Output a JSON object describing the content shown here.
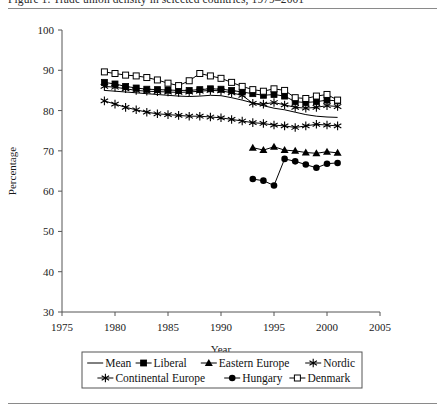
{
  "figure": {
    "title_cut": "Figure 1. Trade union density in selected countries, 1979–2001",
    "y_axis_label": "Percentage",
    "x_axis_label": "Year"
  },
  "chart_data": {
    "type": "line",
    "title": "",
    "xlabel": "Year",
    "ylabel": "Percentage",
    "xlim": [
      1975,
      2005
    ],
    "ylim": [
      30,
      100
    ],
    "xticks": [
      1975,
      1980,
      1985,
      1990,
      1995,
      2000,
      2005
    ],
    "yticks": [
      30,
      40,
      50,
      60,
      70,
      80,
      90,
      100
    ],
    "grid": false,
    "legend_position": "below-axes",
    "series": [
      {
        "name": "Mean",
        "marker": "none",
        "x": [
          1979,
          1980,
          1981,
          1982,
          1983,
          1984,
          1985,
          1986,
          1987,
          1988,
          1989,
          1990,
          1991,
          1992,
          1993,
          1994,
          1995,
          1996,
          1997,
          1998,
          1999,
          2000,
          2001
        ],
        "values": [
          85.0,
          84.8,
          84.6,
          84.4,
          84.2,
          84.0,
          83.8,
          83.6,
          83.5,
          83.6,
          83.8,
          83.7,
          83.2,
          82.6,
          81.9,
          81.2,
          80.6,
          80.2,
          79.6,
          79.0,
          78.6,
          78.4,
          78.3
        ]
      },
      {
        "name": "Liberal",
        "marker": "filled-square",
        "x": [
          1979,
          1980,
          1981,
          1982,
          1983,
          1984,
          1985,
          1986,
          1987,
          1988,
          1989,
          1990,
          1991,
          1992,
          1993,
          1994,
          1995,
          1996,
          1997,
          1998,
          1999,
          2000,
          2001
        ],
        "values": [
          87.0,
          86.6,
          86.0,
          85.6,
          85.3,
          85.2,
          85.1,
          85.0,
          85.0,
          85.2,
          85.4,
          85.3,
          85.0,
          84.6,
          84.2,
          83.8,
          84.0,
          83.6,
          82.2,
          82.0,
          82.2,
          82.6,
          82.4
        ]
      },
      {
        "name": "Eastern Europe",
        "marker": "filled-triangle",
        "x": [
          1993,
          1994,
          1995,
          1996,
          1997,
          1998,
          1999,
          2000,
          2001
        ],
        "values": [
          70.8,
          70.2,
          71.0,
          70.2,
          70.0,
          69.6,
          69.4,
          69.8,
          69.5
        ]
      },
      {
        "name": "Nordic",
        "marker": "star",
        "x": [
          1979,
          1980,
          1981,
          1982,
          1983,
          1984,
          1985,
          1986,
          1987,
          1988,
          1989,
          1990,
          1991,
          1992,
          1993,
          1994,
          1995,
          1996,
          1997,
          1998,
          1999,
          2000,
          2001
        ],
        "values": [
          86.0,
          85.8,
          85.4,
          85.0,
          84.8,
          84.7,
          84.6,
          84.5,
          84.6,
          84.8,
          85.0,
          84.9,
          84.4,
          83.8,
          81.8,
          81.6,
          82.0,
          81.4,
          80.8,
          80.6,
          80.8,
          81.2,
          81.0
        ]
      },
      {
        "name": "Continental Europe",
        "marker": "star",
        "x": [
          1979,
          1980,
          1981,
          1982,
          1983,
          1984,
          1985,
          1986,
          1987,
          1988,
          1989,
          1990,
          1991,
          1992,
          1993,
          1994,
          1995,
          1996,
          1997,
          1998,
          1999,
          2000,
          2001
        ],
        "values": [
          82.4,
          81.6,
          80.8,
          80.2,
          79.6,
          79.2,
          79.0,
          78.8,
          78.6,
          78.6,
          78.4,
          78.2,
          77.8,
          77.4,
          77.0,
          76.8,
          76.4,
          76.2,
          75.8,
          76.2,
          76.6,
          76.4,
          76.2
        ]
      },
      {
        "name": "Hungary",
        "marker": "filled-circle",
        "x": [
          1993,
          1994,
          1995,
          1996,
          1997,
          1998,
          1999,
          2000,
          2001
        ],
        "values": [
          63.0,
          62.6,
          61.4,
          68.0,
          67.4,
          66.6,
          65.8,
          66.8,
          67.0
        ]
      },
      {
        "name": "Denmark",
        "marker": "open-square",
        "x": [
          1979,
          1980,
          1981,
          1982,
          1983,
          1984,
          1985,
          1986,
          1987,
          1988,
          1989,
          1990,
          1991,
          1992,
          1993,
          1994,
          1995,
          1996,
          1997,
          1998,
          1999,
          2000,
          2001
        ],
        "values": [
          89.6,
          89.2,
          88.8,
          88.6,
          88.2,
          87.6,
          86.8,
          86.2,
          87.4,
          89.2,
          88.6,
          88.0,
          87.0,
          86.0,
          85.2,
          84.8,
          85.4,
          85.0,
          83.2,
          83.0,
          83.6,
          84.0,
          82.6
        ]
      }
    ]
  },
  "legend": {
    "row1": [
      {
        "label": "Mean",
        "marker": "none"
      },
      {
        "label": "Liberal",
        "marker": "filled-square"
      },
      {
        "label": "Eastern Europe",
        "marker": "filled-triangle"
      },
      {
        "label": "Nordic",
        "marker": "star"
      }
    ],
    "row2": [
      {
        "label": "Continental Europe",
        "marker": "star"
      },
      {
        "label": "Hungary",
        "marker": "filled-circle"
      },
      {
        "label": "Denmark",
        "marker": "open-square"
      }
    ]
  }
}
